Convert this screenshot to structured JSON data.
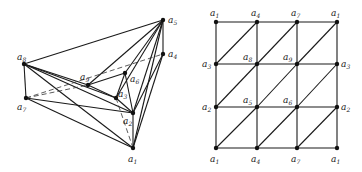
{
  "left_diagram": {
    "name": "polyhedral-embedding",
    "vertices": [
      {
        "id": "a1",
        "label": "a",
        "sub": "1",
        "x": 133,
        "y": 148,
        "lx": 128,
        "ly": 162
      },
      {
        "id": "a2",
        "label": "a",
        "sub": "2",
        "x": 133,
        "y": 113,
        "lx": 123,
        "ly": 124
      },
      {
        "id": "a3",
        "label": "a",
        "sub": "3",
        "x": 116,
        "y": 98,
        "lx": 118,
        "ly": 97
      },
      {
        "id": "a4",
        "label": "a",
        "sub": "4",
        "x": 163,
        "y": 54,
        "lx": 168,
        "ly": 57
      },
      {
        "id": "a5",
        "label": "a",
        "sub": "5",
        "x": 163,
        "y": 20,
        "lx": 168,
        "ly": 23
      },
      {
        "id": "a6",
        "label": "a",
        "sub": "6",
        "x": 125,
        "y": 73,
        "lx": 130,
        "ly": 82
      },
      {
        "id": "a7",
        "label": "a",
        "sub": "7",
        "x": 26,
        "y": 98,
        "lx": 17,
        "ly": 110
      },
      {
        "id": "a8",
        "label": "a",
        "sub": "8",
        "x": 24,
        "y": 64,
        "lx": 17,
        "ly": 60
      },
      {
        "id": "a9",
        "label": "a",
        "sub": "9",
        "x": 88,
        "y": 85,
        "lx": 80,
        "ly": 80
      }
    ],
    "edges": [
      [
        "a8",
        "a5"
      ],
      [
        "a8",
        "a7"
      ],
      [
        "a8",
        "a9"
      ],
      [
        "a8",
        "a3"
      ],
      [
        "a8",
        "a2"
      ],
      [
        "a8",
        "a1"
      ],
      [
        "a7",
        "a2"
      ],
      [
        "a7",
        "a1"
      ],
      [
        "a5",
        "a9"
      ],
      [
        "a5",
        "a6"
      ],
      [
        "a5",
        "a2"
      ],
      [
        "a5",
        "a1"
      ],
      [
        "a5",
        "a4"
      ],
      [
        "a5",
        "a3"
      ],
      [
        "a4",
        "a1"
      ],
      [
        "a4",
        "a2"
      ],
      [
        "a9",
        "a6"
      ],
      [
        "a9",
        "a3"
      ],
      [
        "a6",
        "a3"
      ],
      [
        "a6",
        "a2"
      ],
      [
        "a3",
        "a2"
      ],
      [
        "a2",
        "a1"
      ]
    ],
    "dashed_edges": [
      [
        "a7",
        "a4"
      ],
      [
        "a7",
        "a9"
      ],
      [
        "a3",
        "a1"
      ]
    ]
  },
  "right_diagram": {
    "name": "torus-triangulation-grid",
    "xs": [
      216,
      257,
      297,
      337
    ],
    "ys": [
      22,
      64,
      107,
      148
    ],
    "labels": [
      [
        {
          "t": "a",
          "s": "1"
        },
        {
          "t": "a",
          "s": "4"
        },
        {
          "t": "a",
          "s": "7"
        },
        {
          "t": "a",
          "s": "1"
        }
      ],
      [
        {
          "t": "a",
          "s": "3"
        },
        {
          "t": "a",
          "s": "8"
        },
        {
          "t": "a",
          "s": "9"
        },
        {
          "t": "a",
          "s": "3"
        }
      ],
      [
        {
          "t": "a",
          "s": "2"
        },
        {
          "t": "a",
          "s": "5"
        },
        {
          "t": "a",
          "s": "6"
        },
        {
          "t": "a",
          "s": "2"
        }
      ],
      [
        {
          "t": "a",
          "s": "1"
        },
        {
          "t": "a",
          "s": "4"
        },
        {
          "t": "a",
          "s": "7"
        },
        {
          "t": "a",
          "s": "1"
        }
      ]
    ]
  }
}
